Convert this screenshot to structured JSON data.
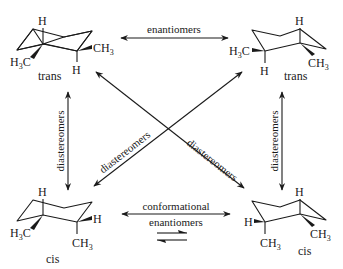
{
  "molecules": {
    "top_left": {
      "label": "trans",
      "atoms": {
        "h_top": "H",
        "ch3_left": "H3C",
        "ch3_right": "CH3",
        "h_bottom": "H"
      }
    },
    "top_right": {
      "label": "trans",
      "atoms": {
        "h_top": "H",
        "ch3_left": "H3C",
        "ch3_right": "CH3",
        "h_bottom": "H"
      }
    },
    "bottom_left": {
      "label": "cis",
      "atoms": {
        "h_top": "H",
        "ch3_left": "H3C",
        "h_right": "H",
        "ch3_bottom": "CH3"
      }
    },
    "bottom_right": {
      "label": "cis",
      "atoms": {
        "h_top": "H",
        "h_left": "H",
        "ch3_bottom": "CH3",
        "ch3_right": "CH3"
      }
    }
  },
  "relationships": {
    "top": "enantiomers",
    "left": "diastereomers",
    "right": "diastereomers",
    "diagonal_left": "diastereomers",
    "diagonal_right": "diastereomers",
    "bottom_line1": "conformational",
    "bottom_line2": "enantiomers"
  },
  "colors": {
    "ink": "#1a1a1a",
    "background": "#ffffff"
  }
}
